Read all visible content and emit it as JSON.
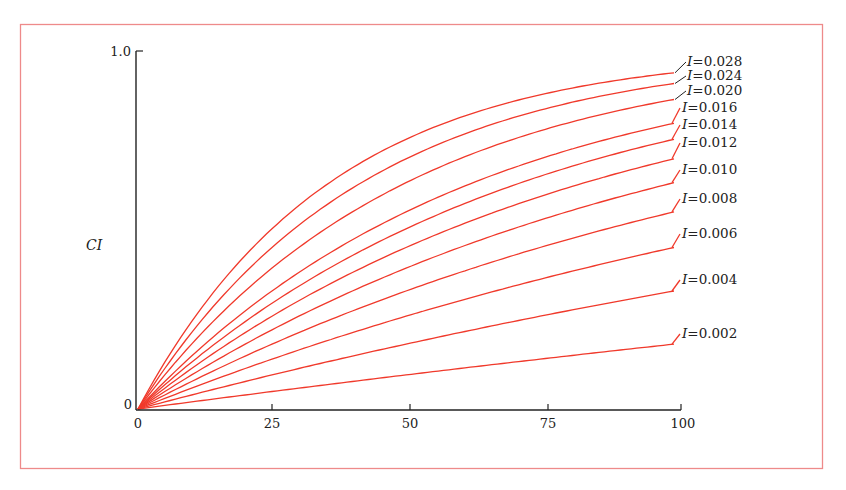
{
  "chart_data": {
    "type": "line",
    "title": "",
    "xlabel": "",
    "ylabel": "CI",
    "xlim": [
      0,
      100
    ],
    "ylim": [
      0,
      1.0
    ],
    "x_ticks": [
      "0",
      "25",
      "50",
      "75",
      "100"
    ],
    "y_ticks": [
      "0",
      "1.0"
    ],
    "grid": false,
    "legend": "inline labels at right end of each curve",
    "model": "CI = 1 - exp(-I * x)",
    "x": [
      0,
      10,
      20,
      30,
      40,
      50,
      60,
      70,
      80,
      90,
      100
    ],
    "series": [
      {
        "name": "I=0.028",
        "I": 0.028,
        "values": [
          0,
          0.244,
          0.429,
          0.568,
          0.674,
          0.753,
          0.814,
          0.859,
          0.894,
          0.92,
          0.939
        ]
      },
      {
        "name": "I=0.024",
        "I": 0.024,
        "values": [
          0,
          0.213,
          0.381,
          0.513,
          0.617,
          0.699,
          0.763,
          0.814,
          0.853,
          0.885,
          0.909
        ]
      },
      {
        "name": "I=0.020",
        "I": 0.02,
        "values": [
          0,
          0.181,
          0.33,
          0.451,
          0.551,
          0.632,
          0.699,
          0.753,
          0.798,
          0.835,
          0.865
        ]
      },
      {
        "name": "I=0.016",
        "I": 0.016,
        "values": [
          0,
          0.148,
          0.274,
          0.381,
          0.473,
          0.551,
          0.617,
          0.674,
          0.722,
          0.763,
          0.798
        ]
      },
      {
        "name": "I=0.014",
        "I": 0.014,
        "values": [
          0,
          0.131,
          0.244,
          0.343,
          0.429,
          0.503,
          0.568,
          0.625,
          0.674,
          0.716,
          0.753
        ]
      },
      {
        "name": "I=0.012",
        "I": 0.012,
        "values": [
          0,
          0.113,
          0.213,
          0.302,
          0.381,
          0.451,
          0.513,
          0.568,
          0.617,
          0.66,
          0.699
        ]
      },
      {
        "name": "I=0.010",
        "I": 0.01,
        "values": [
          0,
          0.095,
          0.181,
          0.259,
          0.33,
          0.393,
          0.451,
          0.503,
          0.551,
          0.593,
          0.632
        ]
      },
      {
        "name": "I=0.008",
        "I": 0.008,
        "values": [
          0,
          0.077,
          0.148,
          0.213,
          0.274,
          0.33,
          0.381,
          0.429,
          0.473,
          0.513,
          0.551
        ]
      },
      {
        "name": "I=0.006",
        "I": 0.006,
        "values": [
          0,
          0.058,
          0.113,
          0.165,
          0.213,
          0.259,
          0.302,
          0.343,
          0.381,
          0.417,
          0.451
        ]
      },
      {
        "name": "I=0.004",
        "I": 0.004,
        "values": [
          0,
          0.039,
          0.077,
          0.113,
          0.148,
          0.181,
          0.213,
          0.244,
          0.274,
          0.302,
          0.33
        ]
      },
      {
        "name": "I=0.002",
        "I": 0.002,
        "values": [
          0,
          0.02,
          0.039,
          0.058,
          0.077,
          0.095,
          0.113,
          0.131,
          0.148,
          0.165,
          0.181
        ]
      }
    ],
    "labels": [
      {
        "prefix": "I",
        "value": "=0.028",
        "y": 66,
        "leader": true
      },
      {
        "prefix": "I",
        "value": "=0.024",
        "y": 80,
        "leader": true
      },
      {
        "prefix": "I",
        "value": "=0.020",
        "y": 95,
        "leader": true
      },
      {
        "prefix": "I",
        "value": "=0.016",
        "y": 112,
        "leader": false
      },
      {
        "prefix": "I",
        "value": "=0.014",
        "y": 129,
        "leader": false
      },
      {
        "prefix": "I",
        "value": "=0.012",
        "y": 147,
        "leader": false
      },
      {
        "prefix": "I",
        "value": "=0.010",
        "y": 174,
        "leader": false
      },
      {
        "prefix": "I",
        "value": "=0.008",
        "y": 203,
        "leader": false
      },
      {
        "prefix": "I",
        "value": "=0.006",
        "y": 238,
        "leader": false
      },
      {
        "prefix": "I",
        "value": "=0.004",
        "y": 284,
        "leader": false
      },
      {
        "prefix": "I",
        "value": "=0.002",
        "y": 338,
        "leader": false
      }
    ],
    "colors": {
      "curve": "#f0392b",
      "frame": "#ee8a8a",
      "axis": "#222222"
    }
  }
}
